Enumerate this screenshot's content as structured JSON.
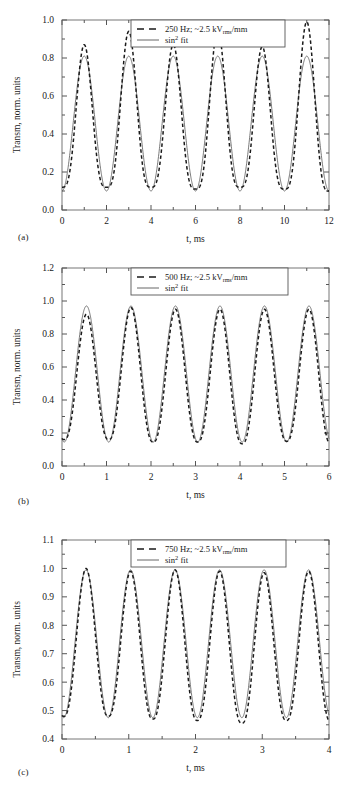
{
  "figure": {
    "panels": [
      {
        "id": "a",
        "caption": "(a)",
        "xlabel": "t, ms",
        "ylabel": "Transm, norm. units",
        "legend": {
          "data_label_main": "250 Hz; ~2.5 kV",
          "data_label_sub": "rms",
          "data_label_tail": "/mm",
          "fit_label_main": "sin",
          "fit_label_sup": "2",
          "fit_label_tail": " fit"
        },
        "xticks": [
          "0",
          "2",
          "4",
          "6",
          "8",
          "10",
          "12"
        ],
        "yticks": [
          "0.0",
          "0.2",
          "0.4",
          "0.6",
          "0.8",
          "1.0"
        ]
      },
      {
        "id": "b",
        "caption": "(b)",
        "xlabel": "t, ms",
        "ylabel": "Transm, norm. units",
        "legend": {
          "data_label_main": "500 Hz; ~2.5 kV",
          "data_label_sub": "rms",
          "data_label_tail": "/mm",
          "fit_label_main": "sin",
          "fit_label_sup": "2",
          "fit_label_tail": " fit"
        },
        "xticks": [
          "0",
          "1",
          "2",
          "3",
          "4",
          "5",
          "6"
        ],
        "yticks": [
          "0.0",
          "0.2",
          "0.4",
          "0.6",
          "0.8",
          "1.0",
          "1.2"
        ]
      },
      {
        "id": "c",
        "caption": "(c)",
        "xlabel": "t, ms",
        "ylabel": "Transm, norm. units",
        "legend": {
          "data_label_main": "750 Hz; ~2.5 kV",
          "data_label_sub": "rms",
          "data_label_tail": "/mm",
          "fit_label_main": "sin",
          "fit_label_sup": "2",
          "fit_label_tail": " fit"
        },
        "xticks": [
          "0",
          "1",
          "2",
          "3",
          "4"
        ],
        "yticks": [
          "0.4",
          "0.5",
          "0.6",
          "0.7",
          "0.8",
          "0.9",
          "1.0",
          "1.1"
        ]
      }
    ]
  },
  "chart_data": [
    {
      "type": "line",
      "panel": "a",
      "title": "",
      "xlabel": "t, ms",
      "ylabel": "Transm, norm. units",
      "xlim": [
        0,
        12
      ],
      "ylim": [
        0.0,
        1.0
      ],
      "xticks": [
        0,
        2,
        4,
        6,
        8,
        10,
        12
      ],
      "yticks": [
        0.0,
        0.2,
        0.4,
        0.6,
        0.8,
        1.0
      ],
      "grid": false,
      "legend_position": "top-center",
      "series": [
        {
          "name": "250 Hz; ~2.5 kVrms/mm",
          "style": "dashed",
          "color": "#1a1a1a",
          "period_ms": 2.0,
          "phase_ms": 1.0,
          "min": 0.11,
          "max": 0.87,
          "peak_sharpness": 1.7,
          "peak_values": [
            0.87,
            0.94,
            0.87,
            0.95,
            0.86,
            0.99
          ],
          "peak_times": [
            1.0,
            3.0,
            5.0,
            7.0,
            9.0,
            11.0
          ],
          "trough_values": [
            0.12,
            0.12,
            0.11,
            0.12,
            0.11,
            0.1
          ],
          "trough_times": [
            2.0,
            4.0,
            6.0,
            8.0,
            10.0,
            12.0
          ]
        },
        {
          "name": "sin^2 fit",
          "style": "solid",
          "color": "#555555",
          "period_ms": 2.0,
          "phase_ms": 1.0,
          "min": 0.1,
          "max": 0.81
        }
      ]
    },
    {
      "type": "line",
      "panel": "b",
      "title": "",
      "xlabel": "t, ms",
      "ylabel": "Transm, norm. units",
      "xlim": [
        0,
        6
      ],
      "ylim": [
        0.0,
        1.2
      ],
      "xticks": [
        0,
        1,
        2,
        3,
        4,
        5,
        6
      ],
      "yticks": [
        0.0,
        0.2,
        0.4,
        0.6,
        0.8,
        1.0,
        1.2
      ],
      "grid": false,
      "legend_position": "top-center",
      "series": [
        {
          "name": "500 Hz; ~2.5 kVrms/mm",
          "style": "dashed",
          "color": "#1a1a1a",
          "period_ms": 1.0,
          "phase_ms": 0.55,
          "min": 0.14,
          "max": 0.95,
          "peak_values": [
            0.92,
            0.96,
            0.95,
            0.95,
            0.95,
            0.95
          ],
          "peak_times": [
            0.55,
            1.55,
            2.55,
            3.55,
            4.55,
            5.55
          ],
          "trough_values": [
            0.16,
            0.145,
            0.145,
            0.135,
            0.15,
            0.13
          ],
          "trough_times": [
            1.05,
            2.05,
            3.05,
            4.05,
            5.05,
            6.0
          ]
        },
        {
          "name": "sin^2 fit",
          "style": "solid",
          "color": "#555555",
          "period_ms": 1.0,
          "phase_ms": 0.55,
          "min": 0.145,
          "max": 0.97
        }
      ]
    },
    {
      "type": "line",
      "panel": "c",
      "title": "",
      "xlabel": "t, ms",
      "ylabel": "Transm, norm. units",
      "xlim": [
        0,
        4
      ],
      "ylim": [
        0.4,
        1.1
      ],
      "xticks": [
        0,
        1,
        2,
        3,
        4
      ],
      "yticks": [
        0.4,
        0.5,
        0.6,
        0.7,
        0.8,
        0.9,
        1.0,
        1.1
      ],
      "grid": false,
      "legend_position": "top-center",
      "series": [
        {
          "name": "750 Hz; ~2.5 kVrms/mm",
          "style": "dashed",
          "color": "#1a1a1a",
          "period_ms": 0.667,
          "phase_ms": 0.36,
          "min": 0.46,
          "max": 0.99,
          "peak_values": [
            1.0,
            0.99,
            0.995,
            0.99,
            0.985,
            0.99
          ],
          "peak_times": [
            0.36,
            1.03,
            1.7,
            2.36,
            3.03,
            3.7
          ],
          "trough_values": [
            0.48,
            0.47,
            0.465,
            0.455,
            0.465,
            0.46
          ],
          "trough_times": [
            0.7,
            1.36,
            2.03,
            2.7,
            3.36,
            4.0
          ]
        },
        {
          "name": "sin^2 fit",
          "style": "solid",
          "color": "#555555",
          "period_ms": 0.667,
          "phase_ms": 0.36,
          "min": 0.475,
          "max": 0.995
        }
      ]
    }
  ]
}
